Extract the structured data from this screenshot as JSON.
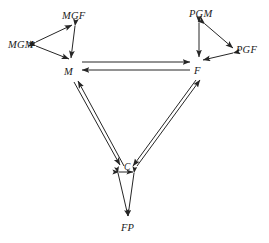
{
  "diagram": {
    "type": "kinship-network-diagram",
    "background_color": "#ffffff",
    "stroke_color": "#262626",
    "nodes": [
      {
        "id": "MGM",
        "label": "MGM",
        "x": 8,
        "y": 40,
        "desc": "maternal grandmother"
      },
      {
        "id": "MGF",
        "label": "MGF",
        "x": 62,
        "y": 11,
        "desc": "maternal grandfather"
      },
      {
        "id": "M",
        "label": "M",
        "x": 64,
        "y": 67,
        "desc": "mother"
      },
      {
        "id": "PGM",
        "label": "PGM",
        "x": 189,
        "y": 9,
        "desc": "paternal grandmother"
      },
      {
        "id": "PGF",
        "label": "PGF",
        "x": 236,
        "y": 45,
        "desc": "paternal grandfather"
      },
      {
        "id": "F",
        "label": "F",
        "x": 194,
        "y": 66,
        "desc": "father"
      },
      {
        "id": "C",
        "label": "C",
        "x": 124,
        "y": 163,
        "desc": "child"
      },
      {
        "id": "FP",
        "label": "FP",
        "x": 121,
        "y": 223,
        "desc": "future partner"
      }
    ],
    "edges": [
      {
        "from": "MGM",
        "to": "MGF",
        "arrows": "both"
      },
      {
        "from": "MGM",
        "to": "M",
        "arrows": "both"
      },
      {
        "from": "MGF",
        "to": "M",
        "arrows": "both"
      },
      {
        "from": "PGM",
        "to": "PGF",
        "arrows": "both"
      },
      {
        "from": "PGM",
        "to": "F",
        "arrows": "both"
      },
      {
        "from": "PGF",
        "to": "F",
        "arrows": "both"
      },
      {
        "from": "M",
        "to": "F",
        "arrows": "both",
        "style": "double-parallel-horizontal"
      },
      {
        "from": "M",
        "to": "C",
        "arrows": "both",
        "style": "double-parallel-diagonal"
      },
      {
        "from": "F",
        "to": "C",
        "arrows": "both",
        "style": "double-parallel-diagonal"
      },
      {
        "from": "C",
        "to": "FP",
        "arrows": "both",
        "style": "double-parallel-narrow"
      }
    ]
  }
}
